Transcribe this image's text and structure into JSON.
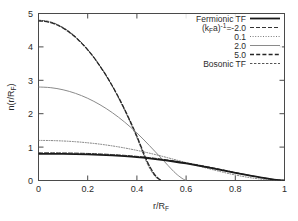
{
  "figure": {
    "background": "#ffffff",
    "frame_color": "#4a4a4a",
    "text_color": "#2b2b2b"
  },
  "chart_data": {
    "type": "line",
    "title": "",
    "xlabel": "r/R_F",
    "xlabel_main": "r/R",
    "xlabel_sub": "F",
    "ylabel": "n(r/R_F)",
    "ylabel_main_a": "n(r/R",
    "ylabel_sub": "F",
    "ylabel_main_b": ")",
    "xlim": [
      0,
      1
    ],
    "ylim": [
      0,
      5
    ],
    "xticks": [
      0,
      0.2,
      0.4,
      0.6,
      0.8,
      1
    ],
    "xticklabels": [
      "0",
      "0.2",
      "0.4",
      "0.6",
      "0.8",
      "1"
    ],
    "yticks": [
      0,
      1,
      2,
      3,
      4,
      5
    ],
    "yticklabels": [
      "0",
      "1",
      "2",
      "3",
      "4",
      "5"
    ],
    "grid": false,
    "legend_position": "top-right",
    "series": [
      {
        "name": "Fermionic TF",
        "label": "Fermionic TF",
        "style": "solid",
        "width": 1.8,
        "color": "#1a1a1a",
        "dash": "",
        "x": [
          0.0,
          0.05,
          0.1,
          0.15,
          0.2,
          0.25,
          0.3,
          0.35,
          0.4,
          0.45,
          0.5,
          0.55,
          0.6,
          0.65,
          0.7,
          0.75,
          0.8,
          0.85,
          0.9,
          0.95,
          1.0
        ],
        "y": [
          0.8,
          0.799,
          0.796,
          0.79,
          0.781,
          0.768,
          0.75,
          0.727,
          0.698,
          0.662,
          0.619,
          0.569,
          0.512,
          0.448,
          0.379,
          0.306,
          0.231,
          0.158,
          0.091,
          0.036,
          0.0
        ]
      },
      {
        "name": "(k_F a)^-1 = -2.0",
        "label": "(k_Fa)⁻¹=-2.0",
        "label_prefix": "(k",
        "label_sub": "F",
        "label_mid": "a)",
        "label_sup": "-1",
        "label_suffix": "=-2.0",
        "style": "dashed",
        "width": 1.0,
        "color": "#333333",
        "dash": "4,2",
        "x": [
          0.0,
          0.05,
          0.1,
          0.15,
          0.2,
          0.25,
          0.3,
          0.35,
          0.4,
          0.45,
          0.5,
          0.55,
          0.6,
          0.65,
          0.7,
          0.75,
          0.8,
          0.85,
          0.9,
          0.95,
          1.0
        ],
        "y": [
          0.83,
          0.829,
          0.826,
          0.82,
          0.81,
          0.796,
          0.777,
          0.753,
          0.723,
          0.686,
          0.641,
          0.589,
          0.53,
          0.464,
          0.393,
          0.318,
          0.241,
          0.165,
          0.095,
          0.038,
          0.0
        ]
      },
      {
        "name": "(k_F a)^-1 = 0.1",
        "label": "0.1",
        "style": "dotted",
        "width": 1.0,
        "color": "#7a7a7a",
        "dash": "1,1.6",
        "x": [
          0.0,
          0.05,
          0.1,
          0.15,
          0.2,
          0.25,
          0.3,
          0.35,
          0.4,
          0.45,
          0.5,
          0.55,
          0.6,
          0.65,
          0.7,
          0.75,
          0.8,
          0.85,
          0.9,
          0.95,
          1.0
        ],
        "y": [
          1.2,
          1.196,
          1.183,
          1.161,
          1.129,
          1.088,
          1.036,
          0.974,
          0.902,
          0.82,
          0.73,
          0.634,
          0.535,
          0.436,
          0.339,
          0.248,
          0.166,
          0.097,
          0.045,
          0.013,
          0.0
        ]
      },
      {
        "name": "(k_F a)^-1 = 2.0",
        "label": "2.0",
        "style": "solid-thin",
        "width": 1.0,
        "color": "#8a8a8a",
        "dash": "",
        "x": [
          0.0,
          0.05,
          0.1,
          0.15,
          0.2,
          0.25,
          0.3,
          0.35,
          0.4,
          0.45,
          0.5,
          0.55,
          0.575,
          0.59,
          0.6
        ],
        "y": [
          2.8,
          2.779,
          2.716,
          2.61,
          2.461,
          2.268,
          2.031,
          1.749,
          1.423,
          1.053,
          0.66,
          0.268,
          0.11,
          0.035,
          0.0
        ]
      },
      {
        "name": "(k_F a)^-1 = 5.0",
        "label": "5.0",
        "style": "dashed",
        "width": 1.3,
        "color": "#262626",
        "dash": "4,2.2",
        "x": [
          0.0,
          0.04,
          0.08,
          0.12,
          0.16,
          0.2,
          0.24,
          0.28,
          0.32,
          0.36,
          0.4,
          0.44,
          0.47,
          0.49,
          0.5
        ],
        "y": [
          4.78,
          4.745,
          4.64,
          4.466,
          4.223,
          3.912,
          3.532,
          3.084,
          2.566,
          1.98,
          1.326,
          0.603,
          0.2,
          0.045,
          0.0
        ]
      },
      {
        "name": "Bosonic TF",
        "label": "Bosonic TF",
        "style": "fine-dashed",
        "width": 1.0,
        "color": "#555555",
        "dash": "2.4,1.6",
        "x": [
          0.0,
          0.04,
          0.08,
          0.12,
          0.16,
          0.2,
          0.24,
          0.28,
          0.32,
          0.36,
          0.4,
          0.44,
          0.47,
          0.49,
          0.5
        ],
        "y": [
          4.8,
          4.765,
          4.659,
          4.483,
          4.237,
          3.92,
          3.533,
          3.076,
          2.549,
          1.951,
          1.283,
          0.545,
          0.16,
          0.03,
          0.0
        ]
      }
    ],
    "legend_entries": [
      {
        "label": "Fermionic TF",
        "style": "solid",
        "rich": false
      },
      {
        "label": "(k_Fa)⁻¹=-2.0",
        "style": "dashed",
        "rich": true
      },
      {
        "label": "0.1",
        "style": "dotted",
        "rich": false
      },
      {
        "label": "2.0",
        "style": "solid-thin",
        "rich": false
      },
      {
        "label": "5.0",
        "style": "dashed-bold",
        "rich": false
      },
      {
        "label": "Bosonic TF",
        "style": "fine-dashed",
        "rich": false
      }
    ]
  }
}
